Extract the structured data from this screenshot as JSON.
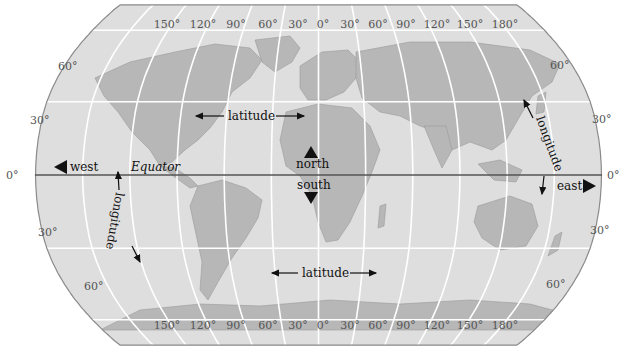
{
  "map": {
    "projection": "Robinson",
    "colors": {
      "ocean": "#dedede",
      "land": "#b7b7b7",
      "coastline": "#9a9a9a",
      "graticule": "#ffffff",
      "border": "#8a8a8a",
      "equator": "#555555",
      "label": "#555555",
      "annotation": "#111111"
    },
    "longitude_labels_top": [
      "150°",
      "120°",
      "90°",
      "60°",
      "30°",
      "0°",
      "30°",
      "60°",
      "90°",
      "120°",
      "150°",
      "180°"
    ],
    "longitude_labels_bottom": [
      "150°",
      "120°",
      "90°",
      "60°",
      "30°",
      "0°",
      "30°",
      "60°",
      "90°",
      "120°",
      "150°",
      "180°"
    ],
    "latitude_labels_left": [
      "60°",
      "30°",
      "0°",
      "30°",
      "60°"
    ],
    "latitude_labels_right": [
      "60°",
      "30°",
      "0°",
      "30°",
      "60°"
    ],
    "annotations": {
      "west": "west",
      "east": "east",
      "north": "north",
      "south": "south",
      "equator": "Equator",
      "latitude_top": "latitude",
      "latitude_bottom": "latitude",
      "longitude_left": "longitude",
      "longitude_right": "longitude"
    }
  }
}
